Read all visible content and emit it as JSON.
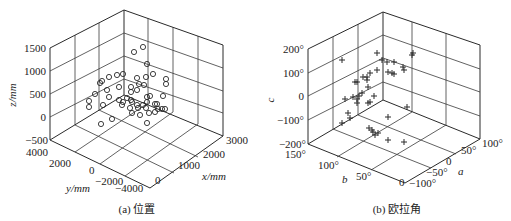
{
  "chart_data": [
    {
      "type": "scatter",
      "dim": "3d",
      "title": "(a) 位置",
      "caption": "(a) 位置",
      "marker": "circle",
      "xlabel": "x/mm",
      "ylabel": "y/mm",
      "zlabel": "z/mm",
      "x_ticks": [
        "0",
        "1000",
        "2000",
        "3000"
      ],
      "y_ticks": [
        "4000",
        "2000",
        "0",
        "−2000",
        "−4000"
      ],
      "z_ticks": [
        "1500",
        "1000",
        "500",
        "0",
        "−500"
      ],
      "xlim": [
        0,
        3000
      ],
      "ylim": [
        -4000,
        4000
      ],
      "zlim": [
        -500,
        1500
      ],
      "grid": true,
      "screen_points": [
        [
          143,
          47
        ],
        [
          134,
          52
        ],
        [
          147,
          64
        ],
        [
          102,
          81
        ],
        [
          109,
          77
        ],
        [
          117,
          75
        ],
        [
          123,
          74
        ],
        [
          137,
          78
        ],
        [
          146,
          77
        ],
        [
          153,
          74
        ],
        [
          166,
          79
        ],
        [
          166,
          84
        ],
        [
          100,
          83
        ],
        [
          119,
          87
        ],
        [
          131,
          87
        ],
        [
          139,
          84
        ],
        [
          144,
          85
        ],
        [
          95,
          94
        ],
        [
          107,
          90
        ],
        [
          131,
          92
        ],
        [
          137,
          90
        ],
        [
          89,
          101
        ],
        [
          89,
          107
        ],
        [
          109,
          97
        ],
        [
          119,
          100
        ],
        [
          123,
          102
        ],
        [
          127,
          98
        ],
        [
          131,
          100
        ],
        [
          147,
          97
        ],
        [
          150,
          96
        ],
        [
          163,
          96
        ],
        [
          103,
          105
        ],
        [
          122,
          105
        ],
        [
          132,
          102
        ],
        [
          137,
          105
        ],
        [
          143,
          105
        ],
        [
          147,
          102
        ],
        [
          155,
          104
        ],
        [
          157,
          104
        ],
        [
          130,
          108
        ],
        [
          138,
          108
        ],
        [
          146,
          108
        ],
        [
          158,
          109
        ],
        [
          162,
          109
        ],
        [
          165,
          109
        ],
        [
          155,
          112
        ],
        [
          132,
          113
        ],
        [
          149,
          113
        ],
        [
          112,
          119
        ],
        [
          101,
          124
        ],
        [
          147,
          123
        ],
        [
          140,
          115
        ]
      ]
    },
    {
      "type": "scatter",
      "dim": "3d",
      "title": "(b) 欧拉角",
      "caption": "(b) 欧拉角",
      "marker": "plus",
      "xlabel": "a",
      "ylabel": "b",
      "zlabel": "c",
      "x_ticks": [
        "−100°",
        "−50°",
        "0",
        "50°",
        "100°"
      ],
      "y_ticks": [
        "150°",
        "100°",
        "50°",
        "0"
      ],
      "z_ticks": [
        "200°",
        "100°",
        "0",
        "−100°",
        "−200°"
      ],
      "xlim": [
        -100,
        100
      ],
      "ylim": [
        0,
        150
      ],
      "zlim": [
        -200,
        200
      ],
      "grid": true,
      "screen_points": [
        [
          342,
          60
        ],
        [
          377,
          53
        ],
        [
          382,
          60
        ],
        [
          387,
          62
        ],
        [
          394,
          62
        ],
        [
          403,
          67
        ],
        [
          404,
          70
        ],
        [
          413,
          53
        ],
        [
          412,
          55
        ],
        [
          388,
          72
        ],
        [
          392,
          73
        ],
        [
          394,
          74
        ],
        [
          377,
          70
        ],
        [
          370,
          73
        ],
        [
          367,
          77
        ],
        [
          363,
          77
        ],
        [
          367,
          80
        ],
        [
          355,
          82
        ],
        [
          357,
          82
        ],
        [
          368,
          87
        ],
        [
          374,
          96
        ],
        [
          362,
          93
        ],
        [
          359,
          96
        ],
        [
          353,
          97
        ],
        [
          357,
          99
        ],
        [
          345,
          99
        ],
        [
          357,
          103
        ],
        [
          368,
          103
        ],
        [
          370,
          102
        ],
        [
          407,
          107
        ],
        [
          388,
          117
        ],
        [
          348,
          113
        ],
        [
          350,
          118
        ],
        [
          342,
          123
        ],
        [
          369,
          128
        ],
        [
          372,
          130
        ],
        [
          373,
          132
        ],
        [
          375,
          135
        ],
        [
          378,
          133
        ],
        [
          388,
          140
        ],
        [
          404,
          142
        ]
      ]
    }
  ],
  "colors": {
    "ink": "#2a2a2a",
    "background": "#ffffff"
  }
}
